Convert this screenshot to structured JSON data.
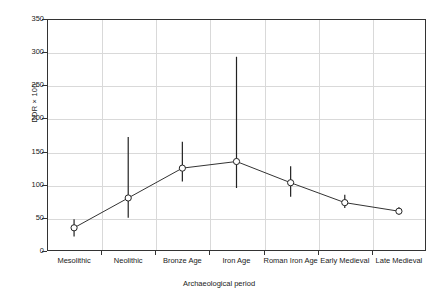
{
  "chart_data": {
    "type": "line",
    "title": "",
    "xlabel": "Archaeological period",
    "ylabel": "DDR × 100",
    "categories": [
      "Mesolithic",
      "Neolithic",
      "Bronze Age",
      "Iron Age",
      "Roman Iron Age",
      "Early Medieval",
      "Late Medieval"
    ],
    "values": [
      35,
      80,
      125,
      135,
      103,
      73,
      60
    ],
    "error_low": [
      22,
      50,
      105,
      95,
      82,
      65,
      55
    ],
    "error_high": [
      48,
      172,
      165,
      293,
      128,
      85,
      66
    ],
    "ylim": [
      0,
      350
    ],
    "yticks": [
      0,
      50,
      100,
      150,
      200,
      250,
      300,
      350
    ],
    "ytick_labels": [
      "0",
      "50",
      "100",
      "150",
      "200",
      "250",
      "300",
      "350"
    ],
    "grid": true,
    "legend": "none",
    "marker": "open-circle",
    "series": [
      {
        "name": "DDR × 100",
        "values": [
          35,
          80,
          125,
          135,
          103,
          73,
          60
        ]
      }
    ]
  },
  "style": {
    "line_color": "#333333",
    "marker_fill": "#ffffff",
    "marker_stroke": "#222222",
    "error_color": "#222222",
    "grid_color": "#d9d9d9",
    "axis_color": "#333333",
    "text_color": "#1a1a1a",
    "background": "#ffffff"
  }
}
